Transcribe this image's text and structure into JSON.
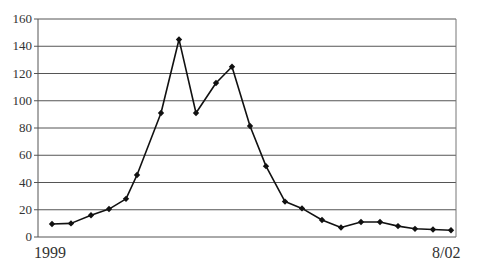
{
  "chart_data": {
    "type": "line",
    "title": "",
    "xlabel": "",
    "ylabel": "",
    "ylim": [
      0,
      160
    ],
    "yticks": [
      0,
      20,
      40,
      60,
      80,
      100,
      120,
      140,
      160
    ],
    "grid": true,
    "legend": null,
    "x_start_label": "1999",
    "x_end_label": "8/02",
    "marker": "diamond",
    "line_color": "#111111",
    "points_x_px": [
      52,
      71,
      91,
      109,
      126,
      137,
      161,
      179,
      196,
      216,
      232,
      250,
      266,
      285,
      302,
      322,
      341,
      361,
      380,
      398,
      415,
      433,
      451
    ],
    "values": [
      9.5,
      10,
      16,
      20.5,
      28,
      45.5,
      91,
      145,
      91,
      113,
      125,
      81.5,
      52,
      26,
      21,
      12.5,
      7,
      11,
      11,
      8,
      6,
      5.5,
      5
    ]
  }
}
